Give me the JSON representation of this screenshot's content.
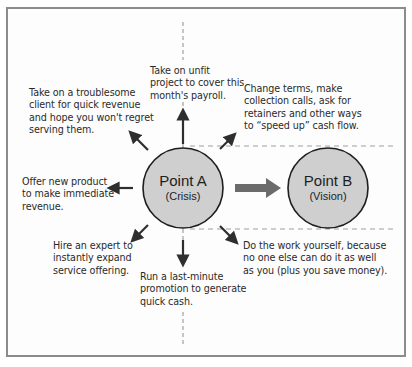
{
  "colors": {
    "frame_border": "#8c8c8c",
    "circle_fill": "#cfcfcf",
    "circle_stroke": "#1e1e1e",
    "arrow": "#2e2e2e",
    "main_arrow": "#6b6b6b",
    "dashed_line": "#a0a0a0",
    "text": "#2a2a2a"
  },
  "point_a": {
    "title": "Point A",
    "subtitle": "(Crisis)"
  },
  "point_b": {
    "title": "Point B",
    "subtitle": "(Vision)"
  },
  "options": {
    "top": [
      "Take on unfit",
      "project to cover this",
      "month's payroll."
    ],
    "top_left": [
      "Take on a troublesome",
      "client for quick revenue",
      "and hope you won't regret",
      "serving them."
    ],
    "top_right": [
      "Change terms, make",
      "collection calls, ask for",
      "retainers and other ways",
      "to “speed up” cash flow."
    ],
    "left": [
      "Offer new product",
      "to make immediate",
      "revenue."
    ],
    "bottom_left": [
      "Hire an expert to",
      "instantly expand",
      "service offering."
    ],
    "bottom": [
      "Run a last-minute",
      "promotion to generate",
      "quick cash."
    ],
    "bottom_right": [
      "Do the work yourself, because",
      "no one else can do it as well",
      "as you (plus you save money)."
    ]
  }
}
